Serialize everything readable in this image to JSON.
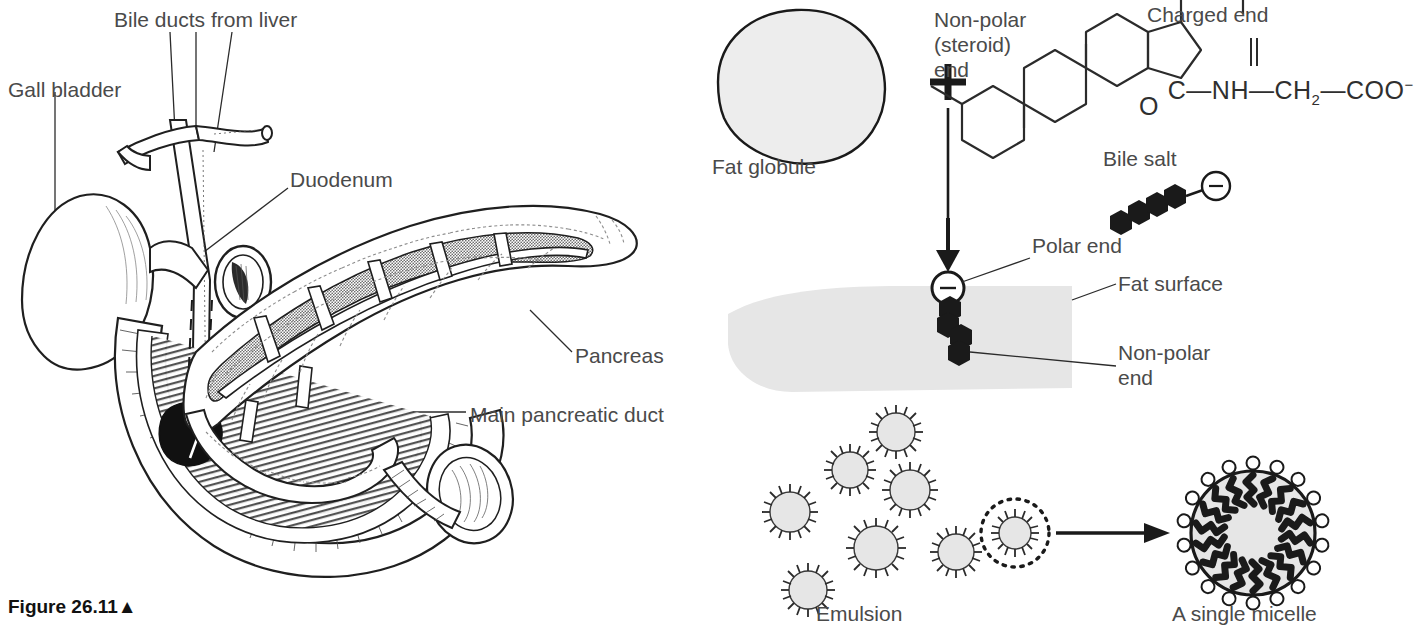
{
  "figure": {
    "caption": "Figure 26.11▲",
    "caption_marker": "▲"
  },
  "left_panel": {
    "name": "pancreas-duodenum-anatomy",
    "labels": [
      {
        "id": "bile-ducts",
        "text": "Bile ducts from liver",
        "x": 114,
        "y": 8
      },
      {
        "id": "gall-bladder",
        "text": "Gall bladder",
        "x": 8,
        "y": 78
      },
      {
        "id": "duodenum",
        "text": "Duodenum",
        "x": 290,
        "y": 168
      },
      {
        "id": "pancreas",
        "text": "Pancreas",
        "x": 575,
        "y": 344
      },
      {
        "id": "main-pancreatic-duct",
        "text": "Main pancreatic duct",
        "x": 470,
        "y": 403
      }
    ]
  },
  "right_panel": {
    "name": "bile-salt-emulsification",
    "stage1": {
      "fat_globule_label": "Fat globule",
      "plus_sign": "+",
      "non_polar_label": "Non-polar\n(steroid)\nend",
      "charged_end_label": "Charged end",
      "bile_salt_label": "Bile salt",
      "formula_main": "C",
      "formula_chain": "—NH—CH",
      "formula_sub": "2",
      "formula_tail": "—COO",
      "formula_charge": "−",
      "formula_oxygen": "O",
      "charge_symbol": "−"
    },
    "stage2": {
      "polar_end_label": "Polar end",
      "fat_surface_label": "Fat surface",
      "non_polar_end_label": "Non-polar\nend",
      "charge_symbol": "−"
    },
    "stage3": {
      "emulsion_label": "Emulsion",
      "micelle_label": "A single micelle",
      "droplet_count": 7
    }
  },
  "colors": {
    "ink": "#1a1a1a",
    "label_gray": "#4a4a4a",
    "fill_light": "#e8e8e8",
    "fill_fat": "#e4e4e4",
    "stipple": "#8a8a8a",
    "white": "#ffffff"
  }
}
